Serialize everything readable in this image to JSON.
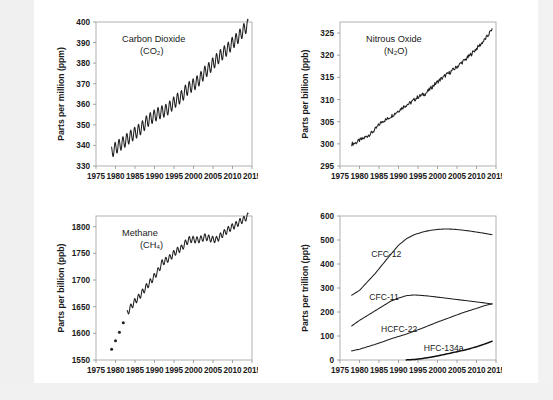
{
  "figure": {
    "panel_count": 4
  },
  "chart_data": [
    {
      "id": "co2",
      "type": "line",
      "title": "Carbon Dioxide",
      "subtitle": "(CO₂)",
      "xlabel": "",
      "ylabel": "Parts per million (ppm)",
      "xlim": [
        1975,
        2015
      ],
      "ylim": [
        330,
        400
      ],
      "xticks": [
        1975,
        1980,
        1985,
        1990,
        1995,
        2000,
        2005,
        2010,
        2015
      ],
      "yticks": [
        330,
        340,
        350,
        360,
        370,
        380,
        390,
        400
      ],
      "grid": false,
      "legend": "none",
      "series": [
        {
          "name": "CO2 monthly mean",
          "style": "oscillating-line",
          "seasonal_amplitude": 3.0,
          "x": [
            1979.0,
            1980.0,
            1981.0,
            1982.0,
            1983.0,
            1984.0,
            1985.0,
            1986.0,
            1987.0,
            1988.0,
            1989.0,
            1990.0,
            1991.0,
            1992.0,
            1993.0,
            1994.0,
            1995.0,
            1996.0,
            1997.0,
            1998.0,
            1999.0,
            2000.0,
            2001.0,
            2002.0,
            2003.0,
            2004.0,
            2005.0,
            2006.0,
            2007.0,
            2008.0,
            2009.0,
            2010.0,
            2011.0,
            2012.0,
            2013.0,
            2014.0
          ],
          "values": [
            336.8,
            338.7,
            340.1,
            341.4,
            343.0,
            344.6,
            346.0,
            347.4,
            349.2,
            351.6,
            353.1,
            354.4,
            355.6,
            356.4,
            357.1,
            358.8,
            360.8,
            362.6,
            363.8,
            366.6,
            368.3,
            369.5,
            371.0,
            373.2,
            375.8,
            377.5,
            379.8,
            381.9,
            383.8,
            385.6,
            387.4,
            389.8,
            391.6,
            393.8,
            396.5,
            398.5
          ]
        }
      ]
    },
    {
      "id": "n2o",
      "type": "line",
      "title": "Nitrous Oxide",
      "subtitle": "(N₂O)",
      "xlabel": "",
      "ylabel": "Parts per billion (ppb)",
      "xlim": [
        1975,
        2015
      ],
      "ylim": [
        295,
        327.5
      ],
      "xticks": [
        1975,
        1980,
        1985,
        1990,
        1995,
        2000,
        2005,
        2010,
        2015
      ],
      "yticks": [
        295,
        300,
        305,
        310,
        315,
        320,
        325
      ],
      "grid": false,
      "legend": "none",
      "series": [
        {
          "name": "N2O monthly mean",
          "style": "noisy-line",
          "noise_amplitude": 0.45,
          "x": [
            1978.0,
            1979.0,
            1980.0,
            1981.0,
            1982.0,
            1983.0,
            1984.0,
            1985.0,
            1986.0,
            1987.0,
            1988.0,
            1989.0,
            1990.0,
            1991.0,
            1992.0,
            1993.0,
            1994.0,
            1995.0,
            1996.0,
            1997.0,
            1998.0,
            1999.0,
            2000.0,
            2001.0,
            2002.0,
            2003.0,
            2004.0,
            2005.0,
            2006.0,
            2007.0,
            2008.0,
            2009.0,
            2010.0,
            2011.0,
            2012.0,
            2013.0,
            2014.0
          ],
          "values": [
            300.0,
            300.2,
            300.8,
            301.2,
            301.8,
            302.4,
            303.2,
            304.3,
            305.2,
            305.5,
            306.2,
            306.8,
            307.5,
            308.2,
            308.8,
            309.2,
            309.9,
            310.6,
            311.0,
            311.4,
            312.3,
            313.2,
            314.0,
            314.7,
            315.4,
            316.0,
            316.7,
            317.4,
            318.2,
            318.9,
            319.7,
            320.6,
            321.5,
            322.4,
            323.4,
            324.5,
            326.0
          ]
        }
      ]
    },
    {
      "id": "ch4",
      "type": "line",
      "title": "Methane",
      "subtitle": "(CH₄)",
      "xlabel": "",
      "ylabel": "Parts per billion (ppb)",
      "xlim": [
        1975,
        2015
      ],
      "ylim": [
        1550,
        1820
      ],
      "xticks": [
        1975,
        1980,
        1985,
        1990,
        1995,
        2000,
        2005,
        2010,
        2015
      ],
      "yticks": [
        1550,
        1600,
        1650,
        1700,
        1750,
        1800
      ],
      "grid": false,
      "legend": "none",
      "series": [
        {
          "name": "CH4 early annual points",
          "style": "points",
          "x": [
            1979.0,
            1980.0,
            1981.0,
            1982.0
          ],
          "values": [
            1570,
            1586,
            1602,
            1620
          ]
        },
        {
          "name": "CH4 monthly mean",
          "style": "oscillating-line",
          "seasonal_amplitude": 6.0,
          "x": [
            1983.0,
            1984.0,
            1985.0,
            1986.0,
            1987.0,
            1988.0,
            1989.0,
            1990.0,
            1991.0,
            1992.0,
            1993.0,
            1994.0,
            1995.0,
            1996.0,
            1997.0,
            1998.0,
            1999.0,
            2000.0,
            2001.0,
            2002.0,
            2003.0,
            2004.0,
            2005.0,
            2006.0,
            2007.0,
            2008.0,
            2009.0,
            2010.0,
            2011.0,
            2012.0,
            2013.0,
            2014.0
          ],
          "values": [
            1638,
            1650,
            1660,
            1668,
            1678,
            1688,
            1697,
            1707,
            1718,
            1733,
            1737,
            1742,
            1750,
            1756,
            1760,
            1770,
            1776,
            1776,
            1775,
            1777,
            1781,
            1778,
            1776,
            1776,
            1783,
            1789,
            1795,
            1800,
            1804,
            1810,
            1814,
            1820
          ]
        }
      ]
    },
    {
      "id": "halocarbons",
      "type": "line",
      "title": "",
      "subtitle": "",
      "xlabel": "",
      "ylabel": "Parts per trillion (ppt)",
      "xlim": [
        1975,
        2015
      ],
      "ylim": [
        0,
        600
      ],
      "xticks": [
        1975,
        1980,
        1985,
        1990,
        1995,
        2000,
        2005,
        2010,
        2015
      ],
      "yticks": [
        0,
        100,
        200,
        300,
        400,
        500,
        600
      ],
      "grid": false,
      "legend": "inline-labels",
      "series": [
        {
          "name": "CFC-12",
          "label": "CFC-12",
          "style": "line",
          "label_x": 1983.0,
          "label_y": 430,
          "x": [
            1978,
            1980,
            1982,
            1984,
            1986,
            1988,
            1990,
            1992,
            1994,
            1996,
            1998,
            2000,
            2002,
            2004,
            2006,
            2008,
            2010,
            2012,
            2014
          ],
          "values": [
            270,
            290,
            325,
            360,
            400,
            440,
            478,
            505,
            522,
            532,
            540,
            544,
            546,
            545,
            542,
            538,
            533,
            528,
            522
          ]
        },
        {
          "name": "CFC-11",
          "label": "CFC-11",
          "style": "line",
          "label_x": 1982.5,
          "label_y": 248,
          "x": [
            1978,
            1980,
            1982,
            1984,
            1986,
            1988,
            1990,
            1992,
            1994,
            1996,
            1998,
            2000,
            2002,
            2004,
            2006,
            2008,
            2010,
            2012,
            2014
          ],
          "values": [
            142,
            165,
            185,
            205,
            225,
            245,
            258,
            268,
            271,
            269,
            266,
            262,
            258,
            254,
            250,
            246,
            242,
            238,
            233
          ]
        },
        {
          "name": "HCFC-22",
          "label": "HCFC-22",
          "style": "line",
          "label_x": 1985.5,
          "label_y": 118,
          "x": [
            1978,
            1980,
            1982,
            1984,
            1986,
            1988,
            1990,
            1992,
            1994,
            1996,
            1998,
            2000,
            2002,
            2004,
            2006,
            2008,
            2010,
            2012,
            2014
          ],
          "values": [
            38,
            45,
            55,
            65,
            76,
            88,
            98,
            108,
            120,
            132,
            145,
            158,
            170,
            182,
            194,
            205,
            215,
            226,
            234
          ]
        },
        {
          "name": "HFC-134a",
          "label": "HFC-134a",
          "style": "line-thick",
          "label_x": 1996.5,
          "label_y": 38,
          "x": [
            1992,
            1994,
            1996,
            1998,
            2000,
            2002,
            2004,
            2006,
            2008,
            2010,
            2012,
            2014
          ],
          "values": [
            0.5,
            2,
            6,
            11,
            17,
            24,
            31,
            38,
            46,
            55,
            66,
            78
          ]
        }
      ]
    }
  ]
}
